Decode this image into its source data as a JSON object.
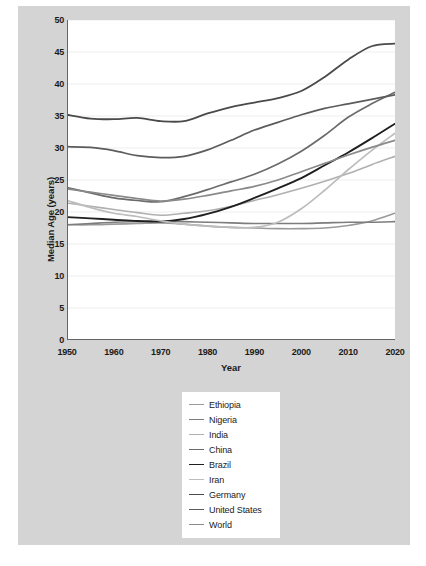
{
  "chart_data": {
    "type": "line",
    "title": "",
    "xlabel": "Year",
    "ylabel": "Median Age (years)",
    "xlim": [
      1950,
      2020
    ],
    "ylim": [
      0,
      50
    ],
    "xticks": [
      1950,
      1960,
      1970,
      1980,
      1990,
      2000,
      2010,
      2020
    ],
    "yticks": [
      0,
      5,
      10,
      15,
      20,
      25,
      30,
      35,
      40,
      45,
      50
    ],
    "grid": true,
    "legend_position": "below-center",
    "x": [
      1950,
      1955,
      1960,
      1965,
      1970,
      1975,
      1980,
      1985,
      1990,
      1995,
      2000,
      2005,
      2010,
      2015,
      2020
    ],
    "series": [
      {
        "name": "Ethiopia",
        "color": "#9a9a9a",
        "width": 1.6,
        "values": [
          18.0,
          18.0,
          18.1,
          18.2,
          18.3,
          18.1,
          17.8,
          17.6,
          17.5,
          17.4,
          17.4,
          17.5,
          17.9,
          18.6,
          19.8
        ]
      },
      {
        "name": "Nigeria",
        "color": "#7d7d7d",
        "width": 1.6,
        "values": [
          18.0,
          18.2,
          18.4,
          18.5,
          18.6,
          18.5,
          18.4,
          18.3,
          18.2,
          18.2,
          18.2,
          18.3,
          18.4,
          18.4,
          18.5
        ]
      },
      {
        "name": "India",
        "color": "#b0b0b0",
        "width": 1.6,
        "values": [
          21.4,
          20.9,
          20.4,
          19.9,
          19.5,
          19.8,
          20.2,
          20.9,
          21.8,
          22.7,
          23.7,
          24.8,
          26.0,
          27.4,
          28.7
        ]
      },
      {
        "name": "China",
        "color": "#6b6b6b",
        "width": 1.7,
        "values": [
          23.8,
          23.0,
          22.2,
          21.8,
          21.6,
          22.4,
          23.5,
          24.7,
          25.9,
          27.5,
          29.5,
          32.0,
          34.8,
          36.9,
          38.7
        ]
      },
      {
        "name": "Brazil",
        "color": "#1f1f1f",
        "width": 1.9,
        "values": [
          19.2,
          19.0,
          18.8,
          18.6,
          18.5,
          18.9,
          19.7,
          20.8,
          22.2,
          23.7,
          25.3,
          27.3,
          29.3,
          31.5,
          33.8
        ]
      },
      {
        "name": "Iran",
        "color": "#bdbdbd",
        "width": 1.7,
        "values": [
          21.8,
          20.7,
          19.8,
          19.3,
          18.6,
          18.1,
          17.8,
          17.6,
          17.6,
          18.4,
          20.5,
          23.4,
          26.6,
          29.6,
          32.3
        ]
      },
      {
        "name": "Germany",
        "color": "#4a4a4a",
        "width": 1.8,
        "values": [
          35.2,
          34.6,
          34.5,
          34.7,
          34.2,
          34.2,
          35.4,
          36.4,
          37.1,
          37.8,
          38.9,
          41.1,
          43.8,
          45.9,
          46.3
        ]
      },
      {
        "name": "United States",
        "color": "#5c5c5c",
        "width": 1.7,
        "values": [
          30.2,
          30.1,
          29.6,
          28.8,
          28.5,
          28.7,
          29.7,
          31.2,
          32.8,
          34.0,
          35.2,
          36.2,
          36.9,
          37.6,
          38.3
        ]
      },
      {
        "name": "World",
        "color": "#8a8a8a",
        "width": 1.7,
        "values": [
          23.6,
          23.1,
          22.6,
          22.1,
          21.7,
          22.0,
          22.6,
          23.3,
          24.0,
          25.0,
          26.3,
          27.6,
          28.9,
          30.1,
          31.2
        ]
      }
    ]
  },
  "legend": {
    "items": [
      {
        "label": "Ethiopia"
      },
      {
        "label": "Nigeria"
      },
      {
        "label": "India"
      },
      {
        "label": "China"
      },
      {
        "label": "Brazil"
      },
      {
        "label": "Iran"
      },
      {
        "label": "Germany"
      },
      {
        "label": "United States"
      },
      {
        "label": "World"
      }
    ]
  },
  "colors": {
    "figure_background": "#d4d4d4",
    "plot_background": "#ffffff",
    "page_background": "#ffffff",
    "axis": "#666666",
    "grid": "#e8e8e8",
    "text": "#1a1a1a"
  }
}
